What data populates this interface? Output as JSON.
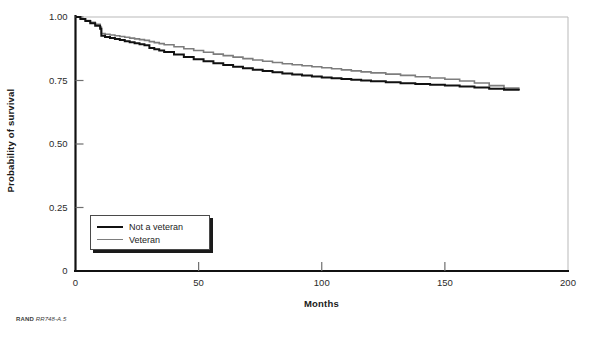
{
  "figure": {
    "credit_org": "RAND",
    "credit_id": "RR748-A.5"
  },
  "chart_data": {
    "type": "line",
    "title": "",
    "xlabel": "Months",
    "ylabel": "Probability of survival",
    "xlim": [
      0,
      200
    ],
    "ylim": [
      0,
      1.0
    ],
    "xticks": [
      0,
      50,
      100,
      150,
      200
    ],
    "xtick_labels": [
      "0",
      "50",
      "100",
      "150",
      "200"
    ],
    "yticks": [
      0,
      0.25,
      0.5,
      0.75,
      1.0
    ],
    "ytick_labels": [
      "0",
      "0.25",
      "0.50",
      "0.75",
      "1.00"
    ],
    "grid": false,
    "legend_position": "lower-left",
    "step_style": "post",
    "series": [
      {
        "name": "Not a veteran",
        "color": "#111111",
        "width": 2.0,
        "x": [
          0,
          2,
          4,
          6,
          8,
          10,
          10.5,
          12,
          14,
          16,
          18,
          20,
          22,
          24,
          26,
          28,
          30,
          32,
          34,
          36,
          40,
          44,
          48,
          52,
          56,
          60,
          64,
          68,
          72,
          76,
          80,
          84,
          88,
          92,
          96,
          100,
          104,
          108,
          112,
          116,
          120,
          126,
          132,
          138,
          144,
          150,
          156,
          162,
          168,
          174,
          180
        ],
        "y": [
          1.0,
          0.992,
          0.984,
          0.975,
          0.966,
          0.954,
          0.926,
          0.921,
          0.917,
          0.913,
          0.909,
          0.905,
          0.901,
          0.897,
          0.893,
          0.889,
          0.878,
          0.873,
          0.868,
          0.862,
          0.852,
          0.843,
          0.834,
          0.826,
          0.818,
          0.811,
          0.804,
          0.798,
          0.792,
          0.787,
          0.782,
          0.778,
          0.774,
          0.77,
          0.766,
          0.762,
          0.759,
          0.756,
          0.753,
          0.75,
          0.747,
          0.743,
          0.739,
          0.736,
          0.733,
          0.73,
          0.726,
          0.722,
          0.718,
          0.714,
          0.711
        ]
      },
      {
        "name": "Veteran",
        "color": "#7d7d7d",
        "width": 1.6,
        "x": [
          0,
          2,
          4,
          6,
          8,
          10,
          10.5,
          12,
          14,
          16,
          18,
          20,
          22,
          24,
          26,
          28,
          30,
          32,
          34,
          36,
          40,
          44,
          48,
          52,
          56,
          60,
          64,
          68,
          72,
          76,
          80,
          84,
          88,
          92,
          96,
          100,
          104,
          108,
          112,
          116,
          120,
          126,
          132,
          138,
          144,
          150,
          156,
          162,
          168,
          174,
          180
        ],
        "y": [
          1.0,
          0.993,
          0.986,
          0.979,
          0.971,
          0.96,
          0.935,
          0.932,
          0.929,
          0.926,
          0.923,
          0.92,
          0.917,
          0.914,
          0.911,
          0.908,
          0.903,
          0.899,
          0.895,
          0.891,
          0.883,
          0.875,
          0.868,
          0.861,
          0.854,
          0.848,
          0.842,
          0.836,
          0.831,
          0.826,
          0.821,
          0.816,
          0.812,
          0.808,
          0.804,
          0.8,
          0.796,
          0.792,
          0.788,
          0.784,
          0.78,
          0.775,
          0.77,
          0.765,
          0.76,
          0.755,
          0.748,
          0.74,
          0.73,
          0.72,
          0.711
        ]
      }
    ]
  }
}
